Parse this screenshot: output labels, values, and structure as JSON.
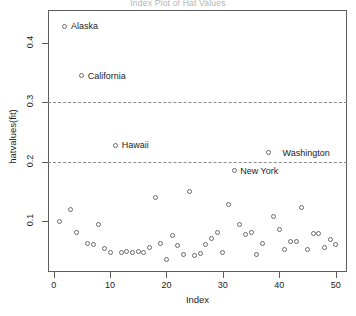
{
  "chart_data": {
    "type": "scatter",
    "title": "Index Plot of Hat Values",
    "xlabel": "Index",
    "ylabel": "hatvalues(fit)",
    "xlim": [
      -1,
      52
    ],
    "ylim": [
      0.015,
      0.455
    ],
    "grid": false,
    "legend": null,
    "xticks": [
      0,
      10,
      20,
      30,
      40,
      50
    ],
    "yticks": [
      0.1,
      0.2,
      0.3,
      0.4
    ],
    "xticklabels": [
      "0",
      "10",
      "20",
      "30",
      "40",
      "50"
    ],
    "yticklabels": [
      "0.1",
      "0.2",
      "0.3",
      "0.4"
    ],
    "reference_lines": [
      {
        "y": 0.3,
        "style": "dashed",
        "label": "0.30"
      },
      {
        "y": 0.2,
        "style": "dashed",
        "label": "0.20"
      }
    ],
    "annotations": [
      {
        "text": "Alaska",
        "x": 2,
        "y": 0.428,
        "side": "right"
      },
      {
        "text": "California",
        "x": 5,
        "y": 0.345,
        "side": "right"
      },
      {
        "text": "Hawaii",
        "x": 11,
        "y": 0.228,
        "side": "right"
      },
      {
        "text": "New York",
        "x": 32,
        "y": 0.185,
        "side": "right"
      },
      {
        "text": "Washington",
        "x": 50,
        "y": 0.215,
        "side": "left"
      }
    ],
    "x": [
      1,
      2,
      3,
      4,
      5,
      6,
      7,
      8,
      9,
      10,
      11,
      12,
      13,
      14,
      15,
      16,
      17,
      18,
      19,
      20,
      21,
      22,
      23,
      24,
      25,
      26,
      27,
      28,
      29,
      30,
      31,
      32,
      33,
      34,
      35,
      36,
      37,
      38,
      39,
      40,
      41,
      42,
      43,
      44,
      45,
      46,
      47,
      48,
      49,
      50
    ],
    "values": [
      0.1,
      0.428,
      0.12,
      0.081,
      0.345,
      0.063,
      0.062,
      0.094,
      0.054,
      0.048,
      0.228,
      0.048,
      0.05,
      0.047,
      0.05,
      0.047,
      0.056,
      0.14,
      0.063,
      0.036,
      0.077,
      0.059,
      0.045,
      0.15,
      0.043,
      0.046,
      0.061,
      0.071,
      0.082,
      0.048,
      0.128,
      0.185,
      0.095,
      0.078,
      0.082,
      0.044,
      0.063,
      0.215,
      0.108,
      0.087,
      0.052,
      0.066,
      0.067,
      0.123,
      0.053,
      0.08,
      0.079,
      0.056,
      0.07,
      0.062
    ],
    "marker": "open-circle",
    "marker_color": "#6b6b6b"
  }
}
